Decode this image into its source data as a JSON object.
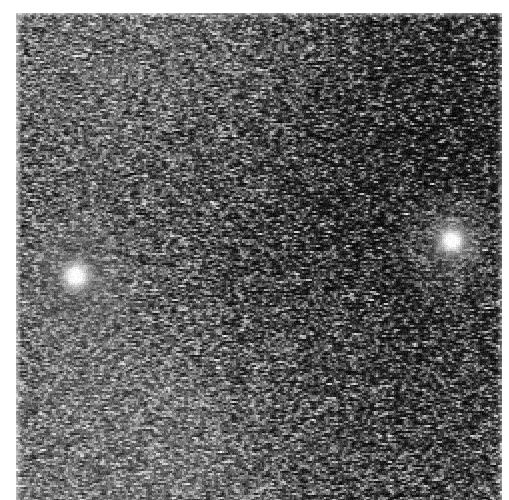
{
  "image": {
    "kind": "astronomical-photographic-plate",
    "title": "Dense star field with two bright globular objects",
    "canvas": {
      "width": 509,
      "height": 500
    },
    "background_color": "#ffffff",
    "field": {
      "x": 16,
      "y": 13,
      "width": 486,
      "height": 487,
      "base_color": "#000000",
      "star_color": "#ffffff",
      "description": "Uniformly dense speckled star field, monochrome grain"
    },
    "grain": {
      "cell_size": 2,
      "density": 0.62,
      "min_level": 0,
      "max_level": 255,
      "seed": 20240517
    },
    "brightness_gradient": {
      "description": "Background star density varies across the field; brighter toward the lower-left and upper-left, darker toward the upper-right and right-center.",
      "nodes": [
        {
          "cx": 0.08,
          "cy": 0.12,
          "strength": 0.2
        },
        {
          "cx": 0.1,
          "cy": 0.88,
          "strength": 0.3
        },
        {
          "cx": 0.32,
          "cy": 0.96,
          "strength": 0.26
        },
        {
          "cx": 0.4,
          "cy": 0.06,
          "strength": 0.16
        },
        {
          "cx": 0.88,
          "cy": 0.14,
          "strength": -0.26
        },
        {
          "cx": 0.96,
          "cy": 0.52,
          "strength": -0.22
        },
        {
          "cx": 0.58,
          "cy": 0.42,
          "strength": -0.14
        },
        {
          "cx": 0.72,
          "cy": 0.92,
          "strength": -0.1
        }
      ]
    },
    "bright_objects": [
      {
        "label": "left-globular-cluster",
        "center_x": 76,
        "center_y": 276,
        "core_radius": 21,
        "halo_radius": 52,
        "peak_level": 236,
        "color": "#f2f2f2"
      },
      {
        "label": "right-globular-cluster",
        "center_x": 452,
        "center_y": 241,
        "core_radius": 18,
        "halo_radius": 46,
        "peak_level": 244,
        "color": "#f7f7f7"
      }
    ]
  }
}
